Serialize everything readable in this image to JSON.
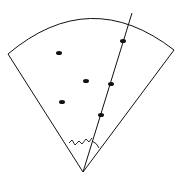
{
  "diagram": {
    "stroke_color": "#111111",
    "apex": [
      83,
      172
    ],
    "left_end": [
      8,
      54
    ],
    "right_end": [
      174,
      50
    ],
    "ray_end": [
      132,
      13
    ],
    "dots": [
      [
        59,
        53
      ],
      [
        86,
        81
      ],
      [
        62,
        102
      ],
      [
        123,
        41
      ],
      [
        111,
        84
      ],
      [
        101,
        115
      ]
    ]
  }
}
